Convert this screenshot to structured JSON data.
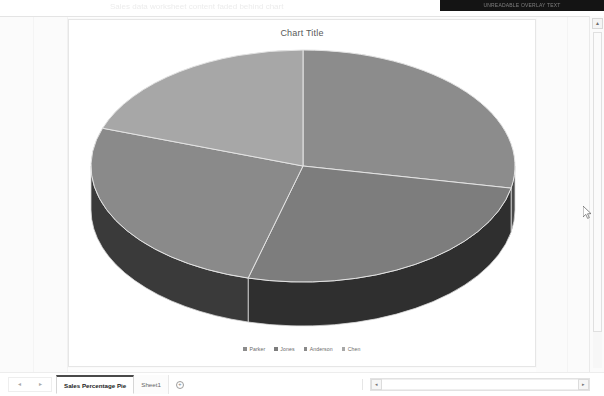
{
  "app": {
    "type": "spreadsheet-chart-sheet",
    "banner_text": "UNREADABLE OVERLAY TEXT"
  },
  "chart": {
    "title": "Chart Title",
    "center_x": 226,
    "center_y": 124,
    "radius_x": 212,
    "radius_y": 116,
    "depth": 44
  },
  "chart_data": {
    "type": "pie",
    "title": "Chart Title",
    "xlabel": "",
    "ylabel": "",
    "legend_position": "bottom",
    "three_d": true,
    "categories": [
      "Parker",
      "Jones",
      "Anderson",
      "Chen"
    ],
    "values": [
      28,
      26,
      26,
      20
    ],
    "series": [
      {
        "name": "Sales Percentage",
        "values": [
          28,
          26,
          26,
          20
        ]
      }
    ],
    "slices": [
      {
        "label": "Parker",
        "value": 28,
        "start_deg": 0,
        "end_deg": 101,
        "color": "#8c8c8c",
        "side_color": "#4a4a4a"
      },
      {
        "label": "Jones",
        "value": 26,
        "start_deg": 101,
        "end_deg": 195,
        "color": "#7d7d7d",
        "side_color": "#2f2f2f"
      },
      {
        "label": "Anderson",
        "value": 26,
        "start_deg": 195,
        "end_deg": 289,
        "color": "#8a8a8a",
        "side_color": "#3a3a3a"
      },
      {
        "label": "Chen",
        "value": 20,
        "start_deg": 289,
        "end_deg": 360,
        "color": "#a7a7a7",
        "side_color": "#585858"
      }
    ],
    "colors": [
      "#8c8c8c",
      "#7d7d7d",
      "#8a8a8a",
      "#a7a7a7"
    ]
  },
  "legend": {
    "items": [
      {
        "label": "Parker",
        "color": "#8c8c8c"
      },
      {
        "label": "Jones",
        "color": "#7d7d7d"
      },
      {
        "label": "Anderson",
        "color": "#8a8a8a"
      },
      {
        "label": "Chen",
        "color": "#a7a7a7"
      }
    ]
  },
  "tabs": {
    "nav_prev": "◂",
    "nav_next": "▸",
    "sheets": [
      {
        "label": "Sales Percentage Pie",
        "active": true
      },
      {
        "label": "Sheet1",
        "active": false
      }
    ],
    "add_label": "+"
  },
  "scrollbars": {
    "vertical_up": "▲",
    "horizontal_left": "◂",
    "horizontal_right": "▸"
  },
  "ghost_text": {
    "line1": "Sales data worksheet content faded behind chart",
    "line2": "percentage totals"
  }
}
